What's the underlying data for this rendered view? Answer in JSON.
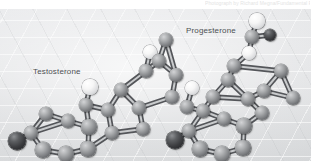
{
  "credit": {
    "text": "Photograph by Richard Megna/Fundamental Photographs, NYC"
  },
  "figure": {
    "alt_name": "ball-and-stick-models-testosterone-progesterone",
    "background_color": "#e3e4e6",
    "grid_line_color": "#ffffff",
    "labels": {
      "left_molecule": "Testosterone",
      "right_molecule": "Progesterone"
    },
    "atom_legend": {
      "carbon": {
        "name": "carbon",
        "color": "#85878a"
      },
      "hydroxyl_or_light": {
        "name": "light-atom",
        "color": "#f2f3f4"
      },
      "oxygen": {
        "name": "oxygen",
        "color": "#2b2c2f"
      }
    },
    "molecules": [
      {
        "name": "Testosterone",
        "label_x": 33,
        "label_y": 58,
        "atoms": [
          {
            "t": "o",
            "x": 17,
            "y": 132,
            "r": 9.0
          },
          {
            "t": "c",
            "x": 31,
            "y": 124,
            "r": 7.2
          },
          {
            "t": "c",
            "x": 43,
            "y": 141,
            "r": 7.6
          },
          {
            "t": "c",
            "x": 66,
            "y": 145,
            "r": 7.8
          },
          {
            "t": "c",
            "x": 88,
            "y": 140,
            "r": 7.6
          },
          {
            "t": "c",
            "x": 89,
            "y": 118,
            "r": 7.6
          },
          {
            "t": "c",
            "x": 68,
            "y": 112,
            "r": 7.4
          },
          {
            "t": "c",
            "x": 46,
            "y": 105,
            "r": 7.2
          },
          {
            "t": "c",
            "x": 86,
            "y": 96,
            "r": 7.4
          },
          {
            "t": "w",
            "x": 90,
            "y": 78,
            "r": 7.6
          },
          {
            "t": "c",
            "x": 108,
            "y": 101,
            "r": 7.4
          },
          {
            "t": "c",
            "x": 112,
            "y": 124,
            "r": 7.4
          },
          {
            "t": "c",
            "x": 121,
            "y": 81,
            "r": 7.2
          },
          {
            "t": "c",
            "x": 139,
            "y": 99,
            "r": 7.4
          },
          {
            "t": "c",
            "x": 143,
            "y": 120,
            "r": 7.4
          },
          {
            "t": "c",
            "x": 146,
            "y": 62,
            "r": 7.2
          },
          {
            "t": "w",
            "x": 150,
            "y": 43,
            "r": 7.4
          },
          {
            "t": "c",
            "x": 159,
            "y": 52,
            "r": 7.0
          },
          {
            "t": "c",
            "x": 166,
            "y": 31,
            "r": 7.2
          },
          {
            "t": "c",
            "x": 176,
            "y": 66,
            "r": 7.2
          },
          {
            "t": "c",
            "x": 172,
            "y": 88,
            "r": 7.4
          }
        ],
        "bonds": [
          [
            0,
            1
          ],
          [
            1,
            2
          ],
          [
            2,
            3
          ],
          [
            3,
            4
          ],
          [
            4,
            5
          ],
          [
            5,
            6
          ],
          [
            6,
            1
          ],
          [
            6,
            7
          ],
          [
            7,
            1
          ],
          [
            5,
            8
          ],
          [
            8,
            9
          ],
          [
            8,
            10
          ],
          [
            10,
            11
          ],
          [
            11,
            4
          ],
          [
            10,
            12
          ],
          [
            12,
            13
          ],
          [
            13,
            14
          ],
          [
            14,
            11
          ],
          [
            12,
            15
          ],
          [
            15,
            16
          ],
          [
            15,
            17
          ],
          [
            17,
            18
          ],
          [
            17,
            19
          ],
          [
            19,
            20
          ],
          [
            20,
            13
          ],
          [
            18,
            19
          ]
        ]
      },
      {
        "name": "Progesterone",
        "label_x": 186,
        "label_y": 17,
        "atoms": [
          {
            "t": "o",
            "x": 175,
            "y": 131,
            "r": 9.0
          },
          {
            "t": "c",
            "x": 189,
            "y": 122,
            "r": 7.4
          },
          {
            "t": "c",
            "x": 200,
            "y": 140,
            "r": 7.6
          },
          {
            "t": "c",
            "x": 222,
            "y": 145,
            "r": 7.8
          },
          {
            "t": "c",
            "x": 243,
            "y": 139,
            "r": 7.6
          },
          {
            "t": "c",
            "x": 244,
            "y": 117,
            "r": 7.6
          },
          {
            "t": "c",
            "x": 224,
            "y": 110,
            "r": 7.4
          },
          {
            "t": "c",
            "x": 203,
            "y": 102,
            "r": 7.2
          },
          {
            "t": "c",
            "x": 187,
            "y": 98,
            "r": 7.2
          },
          {
            "t": "w",
            "x": 192,
            "y": 79,
            "r": 7.4
          },
          {
            "t": "c",
            "x": 213,
            "y": 88,
            "r": 7.2
          },
          {
            "t": "c",
            "x": 228,
            "y": 71,
            "r": 7.2
          },
          {
            "t": "c",
            "x": 234,
            "y": 57,
            "r": 7.0
          },
          {
            "t": "c",
            "x": 248,
            "y": 90,
            "r": 7.4
          },
          {
            "t": "c",
            "x": 262,
            "y": 104,
            "r": 7.2
          },
          {
            "t": "c",
            "x": 264,
            "y": 82,
            "r": 7.2
          },
          {
            "t": "w",
            "x": 249,
            "y": 44,
            "r": 7.4
          },
          {
            "t": "c",
            "x": 252,
            "y": 28,
            "r": 7.0
          },
          {
            "t": "w",
            "x": 257,
            "y": 12,
            "r": 7.6
          },
          {
            "t": "o",
            "x": 270,
            "y": 26,
            "r": 6.2
          },
          {
            "t": "c",
            "x": 281,
            "y": 62,
            "r": 7.2
          },
          {
            "t": "c",
            "x": 293,
            "y": 89,
            "r": 7.0
          }
        ],
        "bonds": [
          [
            0,
            1
          ],
          [
            1,
            2
          ],
          [
            2,
            3
          ],
          [
            3,
            4
          ],
          [
            4,
            5
          ],
          [
            5,
            6
          ],
          [
            6,
            1
          ],
          [
            6,
            7
          ],
          [
            7,
            1
          ],
          [
            7,
            8
          ],
          [
            8,
            9
          ],
          [
            7,
            10
          ],
          [
            10,
            11
          ],
          [
            11,
            12
          ],
          [
            10,
            13
          ],
          [
            13,
            14
          ],
          [
            14,
            5
          ],
          [
            13,
            15
          ],
          [
            15,
            20
          ],
          [
            12,
            16
          ],
          [
            16,
            17
          ],
          [
            17,
            18
          ],
          [
            17,
            19
          ],
          [
            12,
            20
          ],
          [
            20,
            21
          ],
          [
            21,
            15
          ],
          [
            11,
            13
          ]
        ]
      }
    ]
  }
}
